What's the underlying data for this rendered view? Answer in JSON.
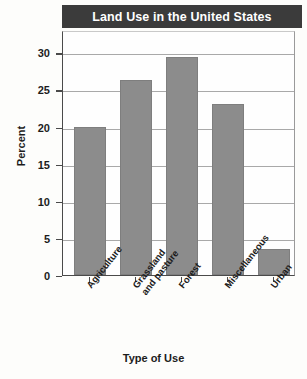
{
  "chart_data": {
    "type": "bar",
    "title": "Land Use in the United States",
    "xlabel": "Type of Use",
    "ylabel": "Percent",
    "categories": [
      "Agriculture",
      "Grassland and pasture",
      "Forest",
      "Miscellaneous",
      "Urban"
    ],
    "values": [
      20,
      26.3,
      29.4,
      23,
      3.5
    ],
    "ylim": [
      0,
      33
    ],
    "yticks": [
      0,
      5,
      10,
      15,
      20,
      25,
      30
    ],
    "ytick_labels": [
      "0",
      "5",
      "10",
      "15",
      "20",
      "25",
      "30"
    ],
    "grid": true,
    "legend": "none",
    "bar_color": "#8c8c8c",
    "title_bar_color": "#3b3b3b",
    "title_text_color": "#ffffff"
  },
  "axis": {
    "y_label": "Percent",
    "x_label": "Type of Use",
    "x_tick_labels": [
      "Agriculture",
      "Grassland\nand pasture",
      "Forest",
      "Miscellaneous",
      "Urban"
    ]
  },
  "header": {
    "title": "Land Use in the United States"
  }
}
